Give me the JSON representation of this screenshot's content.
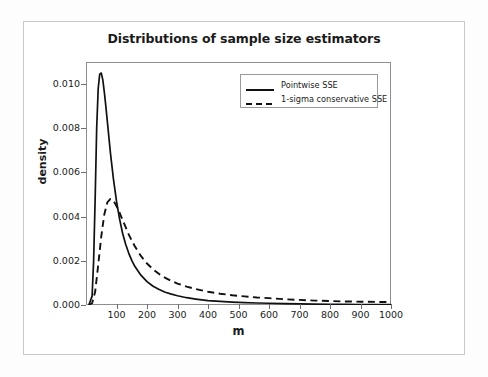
{
  "chart_data": {
    "type": "line",
    "title": "Distributions of sample size estimators",
    "xlabel": "m",
    "ylabel": "density",
    "xlim": [
      0,
      1000
    ],
    "ylim": [
      0.0,
      0.011
    ],
    "grid": false,
    "legend_position": "top-right",
    "xticks": [
      "100",
      "200",
      "300",
      "400",
      "500",
      "600",
      "700",
      "800",
      "900",
      "1000"
    ],
    "xtick_values": [
      100,
      200,
      300,
      400,
      500,
      600,
      700,
      800,
      900,
      1000
    ],
    "yticks": [
      "0.000",
      "0.002",
      "0.004",
      "0.006",
      "0.008",
      "0.010"
    ],
    "ytick_values": [
      0.0,
      0.002,
      0.004,
      0.006,
      0.008,
      0.01
    ],
    "series": [
      {
        "name": "Pointwise SSE",
        "style": "solid",
        "color": "#111111",
        "peak_x": 50,
        "peak_y": 0.0105,
        "x": [
          10,
          20,
          25,
          30,
          35,
          40,
          45,
          50,
          55,
          60,
          65,
          70,
          80,
          90,
          100,
          110,
          120,
          130,
          140,
          150,
          160,
          180,
          200,
          220,
          240,
          260,
          280,
          300,
          330,
          360,
          400,
          440,
          480,
          520,
          560,
          600,
          650,
          700,
          750,
          800,
          850,
          900,
          950,
          1000
        ],
        "y": [
          2e-05,
          0.0004,
          0.002,
          0.0048,
          0.008,
          0.0098,
          0.01045,
          0.0105,
          0.0102,
          0.00965,
          0.009,
          0.0083,
          0.0069,
          0.0057,
          0.0047,
          0.0039,
          0.00325,
          0.00275,
          0.00235,
          0.00202,
          0.00175,
          0.00135,
          0.00106,
          0.00085,
          0.0007,
          0.00058,
          0.00049,
          0.00042,
          0.00033,
          0.00027,
          0.0002,
          0.00016,
          0.00013,
          0.00011,
          9e-05,
          8e-05,
          6e-05,
          5e-05,
          4e-05,
          3e-05,
          2.7e-05,
          2.3e-05,
          2e-05,
          1.8e-05
        ]
      },
      {
        "name": "1-sigma conservative SSE",
        "style": "dashed",
        "color": "#111111",
        "peak_x": 80,
        "peak_y": 0.0048,
        "x": [
          10,
          20,
          30,
          40,
          50,
          60,
          70,
          80,
          90,
          100,
          110,
          120,
          130,
          140,
          150,
          160,
          180,
          200,
          220,
          240,
          260,
          280,
          300,
          330,
          360,
          400,
          440,
          480,
          520,
          560,
          600,
          650,
          700,
          750,
          800,
          850,
          900,
          950,
          1000
        ],
        "y": [
          1e-05,
          8e-05,
          0.0006,
          0.0018,
          0.0031,
          0.0041,
          0.00465,
          0.0048,
          0.00472,
          0.00448,
          0.00418,
          0.00385,
          0.00352,
          0.0032,
          0.00292,
          0.00266,
          0.00222,
          0.00188,
          0.00161,
          0.0014,
          0.00123,
          0.00109,
          0.00097,
          0.00083,
          0.00072,
          0.0006,
          0.00051,
          0.00044,
          0.00039,
          0.00034,
          0.00031,
          0.00026,
          0.00023,
          0.0002,
          0.00018,
          0.00016,
          0.00015,
          0.00014,
          0.00013
        ]
      }
    ]
  },
  "legend": {
    "entries": [
      {
        "label": "Pointwise SSE",
        "style": "solid"
      },
      {
        "label": "1-sigma conservative SSE",
        "style": "dashed"
      }
    ]
  }
}
